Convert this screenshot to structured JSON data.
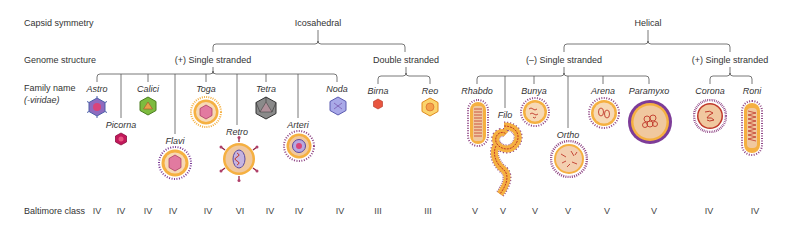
{
  "row_labels": {
    "capsid_symmetry": "Capsid symmetry",
    "genome_structure": "Genome structure",
    "family_name": "Family name",
    "family_suffix": "(-viridae)",
    "baltimore_class": "Baltimore class"
  },
  "capsid": {
    "icosahedral": "Icosahedral",
    "helical": "Helical"
  },
  "genome": {
    "ico_plus_ss": "(+) Single stranded",
    "ico_ds": "Double stranded",
    "hel_minus_ss": "(–) Single stranded",
    "hel_plus_ss": "(+) Single stranded"
  },
  "families": [
    {
      "name": "Astro",
      "baltimore": "IV",
      "group": "icosahedral (+) ssRNA"
    },
    {
      "name": "Picorna",
      "baltimore": "IV",
      "group": "icosahedral (+) ssRNA"
    },
    {
      "name": "Calici",
      "baltimore": "IV",
      "group": "icosahedral (+) ssRNA"
    },
    {
      "name": "Flavi",
      "baltimore": "IV",
      "group": "icosahedral (+) ssRNA"
    },
    {
      "name": "Toga",
      "baltimore": "IV",
      "group": "icosahedral (+) ssRNA"
    },
    {
      "name": "Retro",
      "baltimore": "VI",
      "group": "icosahedral (+) ssRNA"
    },
    {
      "name": "Tetra",
      "baltimore": "IV",
      "group": "icosahedral (+) ssRNA"
    },
    {
      "name": "Arteri",
      "baltimore": "IV",
      "group": "icosahedral (+) ssRNA"
    },
    {
      "name": "Noda",
      "baltimore": "IV",
      "group": "icosahedral (+) ssRNA"
    },
    {
      "name": "Birna",
      "baltimore": "III",
      "group": "icosahedral dsRNA"
    },
    {
      "name": "Reo",
      "baltimore": "III",
      "group": "icosahedral dsRNA"
    },
    {
      "name": "Rhabdo",
      "baltimore": "V",
      "group": "helical (-) ssRNA"
    },
    {
      "name": "Filo",
      "baltimore": "V",
      "group": "helical (-) ssRNA"
    },
    {
      "name": "Bunya",
      "baltimore": "V",
      "group": "helical (-) ssRNA"
    },
    {
      "name": "Ortho",
      "baltimore": "V",
      "group": "helical (-) ssRNA"
    },
    {
      "name": "Arena",
      "baltimore": "V",
      "group": "helical (-) ssRNA"
    },
    {
      "name": "Paramyxo",
      "baltimore": "V",
      "group": "helical (-) ssRNA"
    },
    {
      "name": "Corona",
      "baltimore": "IV",
      "group": "helical (+) ssRNA"
    },
    {
      "name": "Roni",
      "baltimore": "IV",
      "group": "helical (+) ssRNA"
    }
  ],
  "colors": {
    "line": "#555555",
    "envelope_orange": "#f5b041",
    "envelope_cream": "#f7d9b5",
    "spike_purple": "#7d3c98",
    "rna_red": "#c0392b",
    "capsid_pink": "#d9447a",
    "calici_green": "#7dbb3f",
    "tetra_gray": "#777777",
    "noda_blue": "#8e8fd6",
    "birna_red": "#e8553f",
    "reo_yellow": "#f6c453"
  }
}
